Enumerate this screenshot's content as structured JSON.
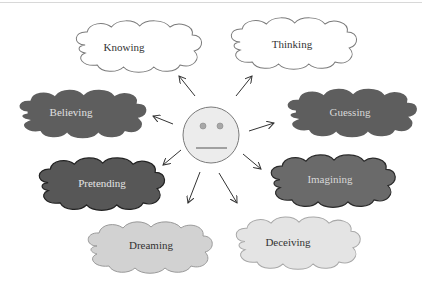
{
  "diagram": {
    "center": {
      "type": "neutral-face",
      "fill": "#ececec",
      "stroke": "#7a7a7a"
    },
    "clouds": [
      {
        "id": "knowing",
        "label": "Knowing",
        "fill": "#ffffff",
        "stroke": "#7a7a7a",
        "text_color": "#333333"
      },
      {
        "id": "thinking",
        "label": "Thinking",
        "fill": "#ffffff",
        "stroke": "#7a7a7a",
        "text_color": "#333333"
      },
      {
        "id": "believing",
        "label": "Believing",
        "fill": "#5e5e5e",
        "stroke": "#ffffff",
        "text_color": "#e0e0e0"
      },
      {
        "id": "guessing",
        "label": "Guessing",
        "fill": "#5e5e5e",
        "stroke": "#ffffff",
        "text_color": "#d8d8d8"
      },
      {
        "id": "pretending",
        "label": "Pretending",
        "fill": "#575757",
        "stroke": "#222222",
        "text_color": "#e4e4e4"
      },
      {
        "id": "imagining",
        "label": "Imagining",
        "fill": "#6a6a6a",
        "stroke": "#2a2a2a",
        "text_color": "#d8d8d8"
      },
      {
        "id": "dreaming",
        "label": "Dreaming",
        "fill": "#d2d2d2",
        "stroke": "#9a9a9a",
        "text_color": "#333333"
      },
      {
        "id": "deceiving",
        "label": "Deceiving",
        "fill": "#e4e4e4",
        "stroke": "#a8a8a8",
        "text_color": "#333333"
      }
    ],
    "arrows": [
      {
        "from": "face",
        "to": "knowing"
      },
      {
        "from": "face",
        "to": "thinking"
      },
      {
        "from": "face",
        "to": "believing"
      },
      {
        "from": "face",
        "to": "guessing"
      },
      {
        "from": "face",
        "to": "pretending"
      },
      {
        "from": "face",
        "to": "imagining"
      },
      {
        "from": "face",
        "to": "dreaming"
      },
      {
        "from": "face",
        "to": "deceiving"
      }
    ]
  }
}
